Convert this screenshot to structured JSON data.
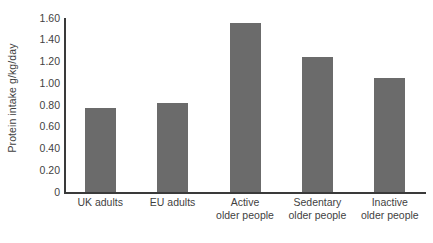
{
  "chart_data": {
    "type": "bar",
    "title": "",
    "subtitle": "",
    "xlabel": "",
    "ylabel": "Protein intake g/kg/day",
    "categories": [
      "UK adults",
      "EU adults",
      "Active older people",
      "Sedentary older people",
      "Inactive older people"
    ],
    "category_lines": [
      [
        "UK adults",
        ""
      ],
      [
        "EU adults",
        ""
      ],
      [
        "Active",
        "older people"
      ],
      [
        "Sedentary",
        "older people"
      ],
      [
        "Inactive",
        "older people"
      ]
    ],
    "values": [
      0.77,
      0.82,
      1.55,
      1.24,
      1.05
    ],
    "ylim": [
      0,
      1.6
    ],
    "yticks": [
      0,
      0.2,
      0.4,
      0.6,
      0.8,
      1.0,
      1.2,
      1.4,
      1.6
    ],
    "ytick_labels": [
      "0",
      "0.20",
      "0.40",
      "0.60",
      "0.80",
      "1.00",
      "1.20",
      "1.40",
      "1.60"
    ],
    "grid": false,
    "legend": false,
    "legend_position": "none",
    "bar_color": "#6b6b6b",
    "axis_color": "#3a3a3a",
    "background_color": "#ffffff",
    "text_color": "#3f3f3f"
  }
}
